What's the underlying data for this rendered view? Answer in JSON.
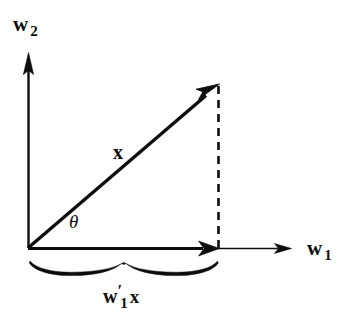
{
  "figure": {
    "kind": "vector-projection-diagram",
    "background_color": "#ffffff",
    "ink_color": "#0d0d0d",
    "width": 353,
    "height": 316
  },
  "axes": {
    "vertical": {
      "name": "w2",
      "label_base": "w",
      "label_sub": "2",
      "origin": [
        28,
        248
      ],
      "tip": [
        28,
        55
      ],
      "arrowhead": "solid-triangle-up"
    },
    "horizontal": {
      "name": "w1",
      "label_base": "w",
      "label_sub": "1",
      "origin": [
        28,
        248
      ],
      "tip": [
        290,
        248
      ],
      "arrowhead": "solid-triangle-right"
    }
  },
  "vector": {
    "label": "x",
    "from": [
      28,
      248
    ],
    "to": [
      218,
      85
    ],
    "angle_degrees": 40.6,
    "arrowhead": "solid-triangle"
  },
  "angle": {
    "label": "θ",
    "between": [
      "w1",
      "x"
    ],
    "vertex": [
      28,
      248
    ]
  },
  "projection": {
    "label_base": "w",
    "label_prime": "′",
    "label_sub": "1",
    "label_operand": "x",
    "from": [
      28,
      248
    ],
    "to": [
      218,
      248
    ],
    "arrowhead": "solid-triangle-right",
    "dashed_drop": {
      "from": [
        218,
        85
      ],
      "to": [
        218,
        248
      ],
      "style": "dashed"
    },
    "brace": {
      "from_x": 30,
      "to_x": 218,
      "y": 262,
      "peak_x": 122,
      "style": "hand-drawn-curly"
    }
  }
}
